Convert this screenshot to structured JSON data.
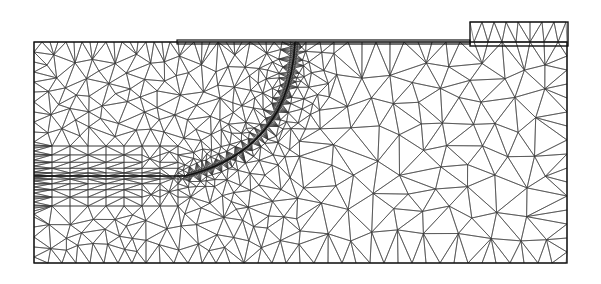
{
  "figure": {
    "type": "finite-element-mesh",
    "colors": {
      "background": "#ffffff",
      "mesh": "#3a3a3a",
      "boundary": "#111111"
    },
    "domain_box": {
      "x0": 34,
      "y0": 42,
      "x1": 567,
      "y1": 263
    },
    "top_plate": {
      "x0": 177,
      "y0": 40,
      "x1": 470,
      "y1": 44
    },
    "corner_block": {
      "x0": 470,
      "y0": 22,
      "x1": 568,
      "y1": 46
    },
    "crack_line": {
      "x0": 34,
      "x1": 185,
      "y": 176
    },
    "refined_arc": {
      "start": [
        295,
        42
      ],
      "control": [
        290,
        150
      ],
      "end": [
        185,
        176
      ]
    }
  }
}
